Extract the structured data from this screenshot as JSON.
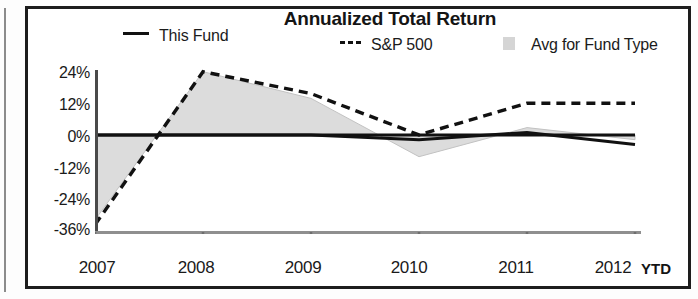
{
  "chart_data": {
    "type": "line",
    "title": "Annualized Total Return",
    "xlabel": "",
    "ylabel": "",
    "x": [
      "2007",
      "2008",
      "2009",
      "2010",
      "2011",
      "2012"
    ],
    "categories": [
      "2007",
      "2008",
      "2009",
      "2010",
      "2011",
      "2012"
    ],
    "x_tick_labels": [
      "2007",
      "2008",
      "2009",
      "2010",
      "2011",
      "2012"
    ],
    "x_axis_suffix": "YTD",
    "y_tick_labels": [
      "24%",
      "12%",
      "0%",
      "-12%",
      "-24%",
      "-36%"
    ],
    "y_tick_values": [
      24,
      12,
      0,
      -12,
      -24,
      -36
    ],
    "ylim": [
      -40,
      30
    ],
    "grid": false,
    "legend_position": "top",
    "series": [
      {
        "name": "This Fund",
        "style": "solid",
        "color": "#111111",
        "values": [
          0,
          0,
          0,
          -2,
          1,
          -4
        ]
      },
      {
        "name": "S&P 500",
        "style": "dashed",
        "color": "#111111",
        "values": [
          -37,
          26,
          17,
          0,
          13,
          13
        ]
      },
      {
        "name": "Avg for Fund Type",
        "style": "filled-area",
        "color": "#d5d5d5",
        "values": [
          -35,
          26,
          15,
          -9,
          3,
          -2
        ]
      }
    ]
  },
  "legend": {
    "fund_label": "This Fund",
    "sp500_label": "S&P 500",
    "avg_label": "Avg for Fund Type"
  },
  "axis": {
    "y": {
      "t0": "24%",
      "t1": "12%",
      "t2": "0%",
      "t3": "-12%",
      "t4": "-24%",
      "t5": "-36%"
    },
    "x": {
      "t0": "2007",
      "t1": "2008",
      "t2": "2009",
      "t3": "2010",
      "t4": "2011",
      "t5": "2012",
      "suffix": "YTD"
    }
  },
  "colors": {
    "line": "#111111",
    "area_fill": "#d5d5d5",
    "frame": "#1d1d1d",
    "text": "#1a1a1a"
  }
}
